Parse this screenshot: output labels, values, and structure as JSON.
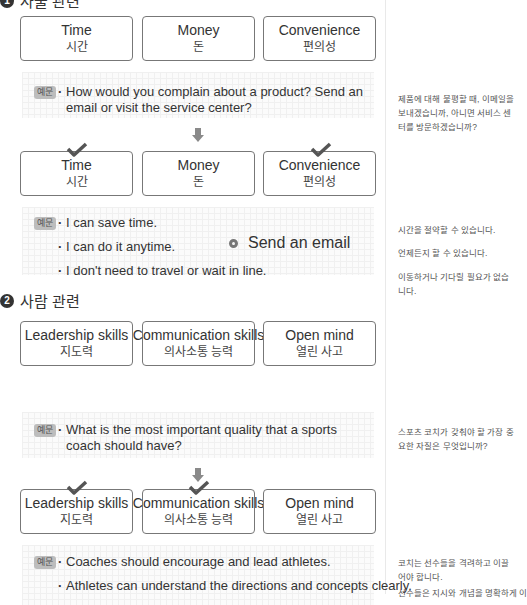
{
  "section1": {
    "number": "1",
    "heading": "사물 관련",
    "options": [
      {
        "en": "Time",
        "ko": "시간"
      },
      {
        "en": "Money",
        "ko": "돈"
      },
      {
        "en": "Convenience",
        "ko": "편의성"
      }
    ],
    "example_badge": "예문",
    "question": "How would you complain about a product? Send an email or visit the service center?",
    "question_ko": "제품에 대해 불평할 때, 이메일을 보내겠습니까, 아니면 서비스 센터를 방문하겠습니까?",
    "selected": [
      "Time",
      "Convenience"
    ],
    "answers": [
      {
        "en": "I can save time.",
        "ko": "시간을 절약할 수 있습니다."
      },
      {
        "en": "I can do it anytime.",
        "ko": "언제든지 할 수 있습니다."
      },
      {
        "en": "I don't need to travel or wait in line.",
        "ko": "이동하거나 기다릴 필요가 없습니다."
      }
    ],
    "conclusion": "Send an email"
  },
  "section2": {
    "number": "2",
    "heading": "사람 관련",
    "options": [
      {
        "en": "Leadership skills",
        "ko": "지도력"
      },
      {
        "en": "Communication skills",
        "ko": "의사소통 능력"
      },
      {
        "en": "Open mind",
        "ko": "열린 사고"
      }
    ],
    "example_badge": "예문",
    "question": "What is the most important quality that a sports coach should have?",
    "question_ko": "스포츠 코치가 갖춰야 할 가장 중요한 자질은 무엇입니까?",
    "selected": [
      "Leadership skills",
      "Communication skills"
    ],
    "answers": [
      {
        "en": "Coaches should encourage and lead athletes.",
        "ko": "코치는 선수들을 격려하고 이끌어야 합니다."
      },
      {
        "en": "Athletes can understand the directions and concepts clearly.",
        "ko": "선수들은 지시와 개념을 명확하게 이"
      }
    ]
  }
}
